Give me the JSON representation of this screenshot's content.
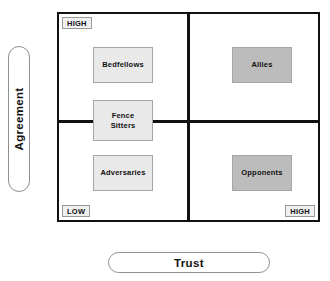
{
  "chart_data": {
    "type": "table",
    "xlabel": "Trust",
    "ylabel": "Agreement",
    "x_ticks": [
      "LOW",
      "HIGH"
    ],
    "y_ticks": [
      "LOW",
      "HIGH"
    ],
    "grid": true,
    "legend": "none",
    "quadrants": [
      {
        "name": "Bedfellows",
        "agreement": "HIGH",
        "trust": "LOW",
        "fill": "#e9e9e9"
      },
      {
        "name": "Allies",
        "agreement": "HIGH",
        "trust": "HIGH",
        "fill": "#bcbcbc"
      },
      {
        "name": "Adversaries",
        "agreement": "LOW",
        "trust": "LOW",
        "fill": "#e9e9e9"
      },
      {
        "name": "Opponents",
        "agreement": "LOW",
        "trust": "HIGH",
        "fill": "#bcbcbc"
      },
      {
        "name": "Fence Sitters",
        "agreement": "MID",
        "trust": "LOW",
        "fill": "#e9e9e9"
      }
    ]
  },
  "axes": {
    "y_label": "Agreement",
    "x_label": "Trust"
  },
  "scale_labels": {
    "agreement_high": "HIGH",
    "trust_low": "LOW",
    "trust_high": "HIGH"
  },
  "boxes": {
    "bedfellows": "Bedfellows",
    "fence_sitters": "Fence\nSitters",
    "adversaries": "Adversaries",
    "allies": "Allies",
    "opponents": "Opponents"
  },
  "colors": {
    "frame": "#111111",
    "fill_light": "#e9e9e9",
    "fill_dark": "#bcbcbc",
    "label_bg": "#f0f0f0",
    "background": "#ffffff"
  }
}
